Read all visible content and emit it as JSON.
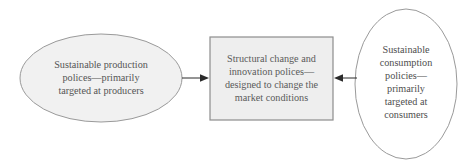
{
  "diagram": {
    "type": "flow-diagram",
    "title": "",
    "background_color": "#ffffff",
    "palette": {
      "shape_fill_shaded": "#f1f1f1",
      "shape_fill_plain": "#ffffff",
      "shape_stroke": "#9a9a9a",
      "box_stroke": "#8d8d8d",
      "arrow_color": "#2b2b2b",
      "text_color": "#555555"
    },
    "nodes": [
      {
        "id": "left-ellipse",
        "shape": "ellipse",
        "fill": "#f1f1f1",
        "stroke": "#9a9a9a",
        "cx": 101,
        "cy": 78,
        "rx": 81,
        "ry": 44,
        "lines": [
          "Sustainable production",
          "polices—primarily",
          "targeted at producers"
        ]
      },
      {
        "id": "center-box",
        "shape": "rectangle",
        "fill": "#eeeeee",
        "stroke": "#8d8d8d",
        "x": 210,
        "y": 37,
        "width": 123,
        "height": 83,
        "lines": [
          "Structural change and",
          "innovation polices—",
          "designed to change the",
          "market conditions"
        ]
      },
      {
        "id": "right-ellipse",
        "shape": "ellipse",
        "fill": "#ffffff",
        "stroke": "#9a9a9a",
        "cx": 406,
        "cy": 84,
        "rx": 51,
        "ry": 75,
        "lines": [
          "Sustainable",
          "consumption",
          "policies—",
          "primarily",
          "targeted at",
          "consumers"
        ]
      }
    ],
    "arrows": [
      {
        "id": "arrow-left-to-box",
        "from": "left-ellipse",
        "to": "center-box",
        "direction": "right",
        "x1": 182,
        "x2": 209,
        "y": 78
      },
      {
        "id": "arrow-right-to-box",
        "from": "right-ellipse",
        "to": "center-box",
        "direction": "left",
        "x1": 357,
        "x2": 334,
        "y": 78
      }
    ]
  }
}
